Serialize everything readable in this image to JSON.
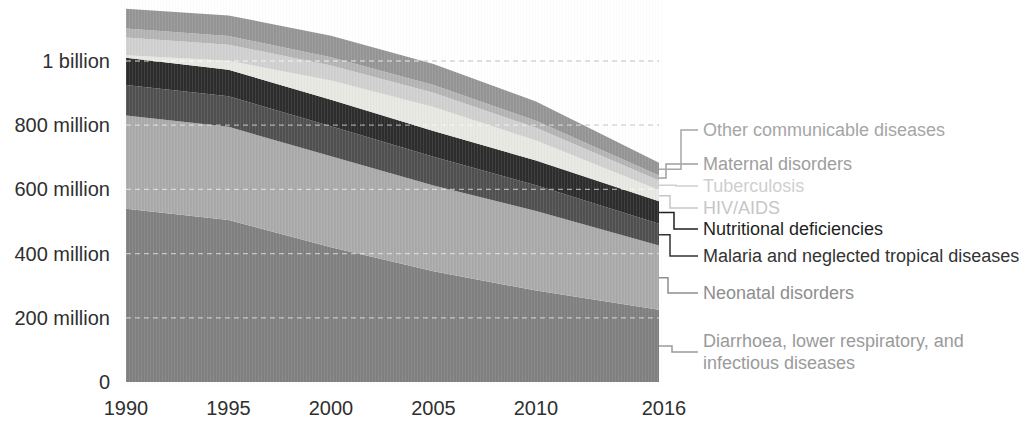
{
  "chart_data": {
    "type": "area",
    "stacked": true,
    "x": [
      1990,
      1995,
      2000,
      2005,
      2010,
      2016
    ],
    "x_tick_labels": [
      "1990",
      "1995",
      "2000",
      "2005",
      "2010",
      "2016"
    ],
    "y_tick_labels": [
      "0",
      "200 million",
      "400 million",
      "600 million",
      "800 million",
      "1 billion"
    ],
    "y_tick_values_millions": [
      0,
      200,
      400,
      600,
      800,
      1000
    ],
    "ylim_millions": [
      0,
      1200
    ],
    "grid": "horizontal-dashed",
    "legend_position": "right",
    "series_order": "bottom-to-top",
    "series": [
      {
        "name": "Diarrhoea, lower respiratory, and infectious diseases",
        "slug": "diarrhoea-lower-respiratory-infectious",
        "label_lines": [
          "Diarrhoea, lower respiratory, and",
          "infectious diseases"
        ],
        "color": "#808080",
        "text_color": "#9a9a9a",
        "values_millions": [
          540,
          505,
          420,
          345,
          285,
          225
        ]
      },
      {
        "name": "Neonatal disorders",
        "slug": "neonatal-disorders",
        "label_lines": [
          "Neonatal disorders"
        ],
        "color": "#aaaaaa",
        "text_color": "#8e8e8e",
        "values_millions": [
          290,
          290,
          283,
          267,
          248,
          200
        ]
      },
      {
        "name": "Malaria and neglected tropical diseases",
        "slug": "malaria-ntd",
        "label_lines": [
          "Malaria and neglected tropical diseases"
        ],
        "color": "#505050",
        "text_color": "#333333",
        "values_millions": [
          95,
          95,
          94,
          90,
          80,
          68
        ]
      },
      {
        "name": "Nutritional deficiencies",
        "slug": "nutritional-deficiencies",
        "label_lines": [
          "Nutritional deficiencies"
        ],
        "color": "#2d2d2d",
        "text_color": "#1f1f1f",
        "values_millions": [
          85,
          83,
          82,
          80,
          77,
          70
        ]
      },
      {
        "name": "HIV/AIDS",
        "slug": "hiv-aids",
        "label_lines": [
          "HIV/AIDS"
        ],
        "color": "#e8e8e2",
        "text_color": "#c6c6c6",
        "values_millions": [
          8,
          28,
          60,
          75,
          62,
          35
        ]
      },
      {
        "name": "Tuberculosis",
        "slug": "tuberculosis",
        "label_lines": [
          "Tuberculosis"
        ],
        "color": "#d0d0d0",
        "text_color": "#cfcfcf",
        "values_millions": [
          55,
          50,
          47,
          44,
          40,
          30
        ]
      },
      {
        "name": "Maternal disorders",
        "slug": "maternal-disorders",
        "label_lines": [
          "Maternal disorders"
        ],
        "color": "#b4b4b4",
        "text_color": "#9e9e9e",
        "values_millions": [
          28,
          27,
          26,
          24,
          22,
          15
        ]
      },
      {
        "name": "Other communicable diseases",
        "slug": "other-communicable",
        "label_lines": [
          "Other communicable diseases"
        ],
        "color": "#959595",
        "text_color": "#a6a6a6",
        "values_millions": [
          62,
          64,
          67,
          66,
          60,
          40
        ]
      }
    ]
  },
  "colors": {
    "background": "#ffffff",
    "axis_text": "#2f2f2f",
    "gridline": "#b6b6b6",
    "gridline_on_bands": "rgba(255,255,255,0.55)"
  }
}
